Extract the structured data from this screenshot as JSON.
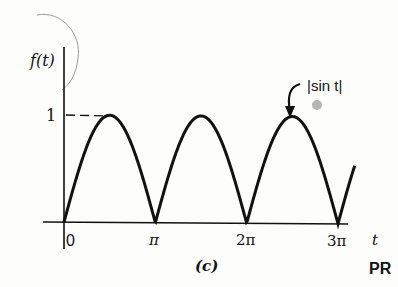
{
  "chart_data": {
    "type": "line",
    "title": "",
    "panel_label": "(c)",
    "xlabel": "t",
    "ylabel": "f(t)",
    "series": [
      {
        "name": "|sin t|",
        "function": "abs(sin(t))",
        "x_range": [
          0,
          10.0
        ],
        "x": [
          0,
          0.785,
          1.571,
          2.356,
          3.142,
          3.927,
          4.712,
          5.498,
          6.283,
          7.069,
          7.854,
          8.639,
          9.425,
          10.0
        ],
        "values": [
          0,
          0.707,
          1,
          0.707,
          0,
          0.707,
          1,
          0.707,
          0,
          0.707,
          1,
          0.707,
          0,
          0.54
        ]
      }
    ],
    "x_ticks": [
      "0",
      "π",
      "2π",
      "3π"
    ],
    "x_tick_values": [
      0,
      3.1416,
      6.2832,
      9.4248
    ],
    "y_ticks": [
      "1"
    ],
    "y_tick_values": [
      1
    ],
    "annotations": [
      {
        "text": "|sin t|",
        "points_to": "peak near t = 5π/2"
      }
    ],
    "reference_lines": [
      {
        "type": "dashed-horizontal",
        "y": 1,
        "from_x": 0,
        "to_x": 1.571
      }
    ],
    "ylim": [
      0,
      1.2
    ],
    "grid": false,
    "legend": "none"
  },
  "labels": {
    "y_axis": "f(t)",
    "x_axis": "t",
    "y_tick_one": "1",
    "x_tick_0": "0",
    "x_tick_pi": "π",
    "x_tick_2pi": "2π",
    "x_tick_3pi": "3π",
    "curve_annotation": "|sin t|",
    "panel": "(c)",
    "corner_mark": "PR"
  },
  "colors": {
    "ink": "#111111",
    "background": "#fdfdfc",
    "pencil_arc": "#9a9a9a",
    "dot": "#b5b5b5"
  }
}
